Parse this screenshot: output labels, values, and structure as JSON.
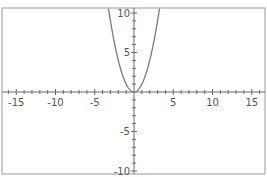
{
  "chart_data": {
    "type": "line",
    "title": "",
    "function": "y = x^2",
    "xlabel": "",
    "ylabel": "",
    "xlim": [
      -17,
      17
    ],
    "ylim": [
      -10.5,
      10.5
    ],
    "x_ticks": [
      -15,
      -10,
      -5,
      5,
      10,
      15
    ],
    "y_ticks": [
      10,
      5,
      -5,
      -10
    ],
    "grid": false,
    "legend": null,
    "series": [
      {
        "name": "y = x^2",
        "x": [
          -3.2,
          -3,
          -2.5,
          -2,
          -1.5,
          -1,
          -0.5,
          0,
          0.5,
          1,
          1.5,
          2,
          2.5,
          3,
          3.2
        ],
        "values": [
          10.24,
          9,
          6.25,
          4,
          2.25,
          1,
          0.25,
          0,
          0.25,
          1,
          2.25,
          4,
          6.25,
          9,
          10.24
        ]
      }
    ],
    "colors": {
      "curve": "#7a7a7a",
      "axis": "#6a6a6a",
      "frame": "#9a9a9a",
      "text": "#555555"
    }
  }
}
